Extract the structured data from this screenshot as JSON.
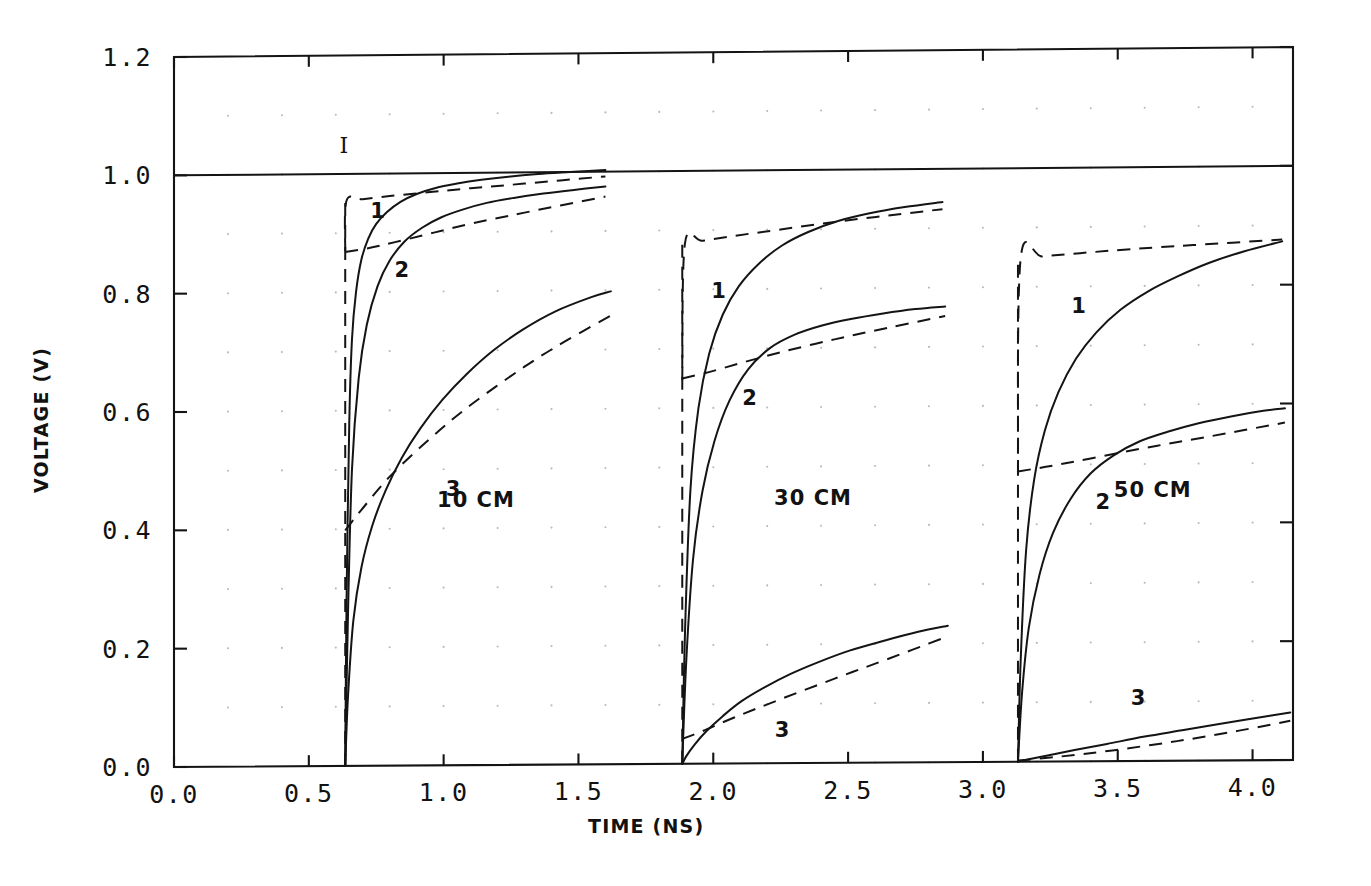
{
  "chart_data": {
    "type": "line",
    "title": "",
    "xlabel": "TIME (NS)",
    "ylabel": "VOLTAGE (V)",
    "xlim": [
      0.0,
      4.15
    ],
    "ylim": [
      0.0,
      1.2
    ],
    "xticks": [
      0.0,
      0.5,
      1.0,
      1.5,
      2.0,
      2.5,
      3.0,
      3.5,
      4.0
    ],
    "xticklabels": [
      "0.0",
      "0.5",
      "1.0",
      "1.5",
      "2.0",
      "2.5",
      "3.0",
      "3.5",
      "4.0"
    ],
    "yticks": [
      0.0,
      0.2,
      0.4,
      0.6,
      0.8,
      1.0,
      1.2
    ],
    "yticklabels": [
      "0.0",
      "0.2",
      "0.4",
      "0.6",
      "0.8",
      "1.0",
      "1.2"
    ],
    "grid": "dotted",
    "grid_x_step": 0.1,
    "grid_y_step": 0.05,
    "legend_position": "inline-annotations",
    "annotations": [
      {
        "text": "I",
        "x": 0.63,
        "y": 1.035,
        "note": "ideal step reference line label"
      },
      {
        "text": "10 CM",
        "x": 1.12,
        "y": 0.435
      },
      {
        "text": "30 CM",
        "x": 2.37,
        "y": 0.435
      },
      {
        "text": "50 CM",
        "x": 3.63,
        "y": 0.445
      },
      {
        "text": "1",
        "x": 0.755,
        "y": 0.925
      },
      {
        "text": "2",
        "x": 0.845,
        "y": 0.825
      },
      {
        "text": "3",
        "x": 1.035,
        "y": 0.455
      },
      {
        "text": "1",
        "x": 2.02,
        "y": 0.785
      },
      {
        "text": "2",
        "x": 2.135,
        "y": 0.605
      },
      {
        "text": "3",
        "x": 2.255,
        "y": 0.045
      },
      {
        "text": "1",
        "x": 3.355,
        "y": 0.755
      },
      {
        "text": "2",
        "x": 3.445,
        "y": 0.425
      },
      {
        "text": "3",
        "x": 3.575,
        "y": 0.095
      }
    ],
    "reference_line": {
      "name": "ideal-step",
      "label": "I",
      "y": 1.0,
      "style": "solid",
      "x_from": 0.0,
      "x_to": 4.15
    },
    "series": [
      {
        "name": "10CM-1-exact",
        "group": "10 CM",
        "curve": "1",
        "style": "solid",
        "x": [
          0.635,
          0.64,
          0.65,
          0.66,
          0.675,
          0.695,
          0.72,
          0.75,
          0.79,
          0.84,
          0.9,
          0.97,
          1.05,
          1.14,
          1.24,
          1.35,
          1.47,
          1.6
        ],
        "y": [
          0.0,
          0.28,
          0.58,
          0.72,
          0.8,
          0.855,
          0.89,
          0.915,
          0.935,
          0.952,
          0.965,
          0.975,
          0.982,
          0.988,
          0.993,
          0.997,
          1.0,
          1.003
        ]
      },
      {
        "name": "10CM-1-approx",
        "group": "10 CM",
        "curve": "1",
        "style": "dashed",
        "x": [
          0.635,
          0.64,
          0.7,
          0.8,
          0.95,
          1.1,
          1.3,
          1.6
        ],
        "y": [
          0.87,
          0.955,
          0.957,
          0.962,
          0.968,
          0.974,
          0.981,
          0.992
        ]
      },
      {
        "name": "10CM-2-exact",
        "group": "10 CM",
        "curve": "2",
        "style": "solid",
        "x": [
          0.635,
          0.645,
          0.66,
          0.685,
          0.715,
          0.755,
          0.8,
          0.855,
          0.92,
          0.99,
          1.07,
          1.16,
          1.26,
          1.37,
          1.49,
          1.6
        ],
        "y": [
          0.0,
          0.25,
          0.5,
          0.655,
          0.745,
          0.81,
          0.853,
          0.885,
          0.908,
          0.925,
          0.938,
          0.949,
          0.957,
          0.964,
          0.97,
          0.975
        ]
      },
      {
        "name": "10CM-2-approx",
        "group": "10 CM",
        "curve": "2",
        "style": "dashed",
        "x": [
          0.635,
          0.72,
          0.82,
          0.95,
          1.1,
          1.3,
          1.6
        ],
        "y": [
          0.868,
          0.874,
          0.884,
          0.898,
          0.914,
          0.932,
          0.958
        ]
      },
      {
        "name": "10CM-3-exact",
        "group": "10 CM",
        "curve": "3",
        "style": "solid",
        "x": [
          0.635,
          0.645,
          0.665,
          0.695,
          0.735,
          0.785,
          0.845,
          0.915,
          0.995,
          1.085,
          1.185,
          1.295,
          1.415,
          1.545,
          1.62
        ],
        "y": [
          0.0,
          0.115,
          0.245,
          0.335,
          0.405,
          0.465,
          0.52,
          0.57,
          0.617,
          0.66,
          0.7,
          0.735,
          0.765,
          0.788,
          0.798
        ]
      },
      {
        "name": "10CM-3-approx",
        "group": "10 CM",
        "curve": "3",
        "style": "dashed",
        "x": [
          0.635,
          0.7,
          0.8,
          0.95,
          1.1,
          1.3,
          1.45,
          1.62
        ],
        "y": [
          0.398,
          0.435,
          0.488,
          0.552,
          0.608,
          0.672,
          0.714,
          0.757
        ]
      },
      {
        "name": "30CM-1-exact",
        "group": "30 CM",
        "curve": "1",
        "style": "solid",
        "x": [
          1.885,
          1.895,
          1.915,
          1.945,
          1.985,
          2.035,
          2.095,
          2.17,
          2.255,
          2.35,
          2.46,
          2.58,
          2.71,
          2.85
        ],
        "y": [
          0.0,
          0.22,
          0.46,
          0.6,
          0.692,
          0.757,
          0.805,
          0.843,
          0.873,
          0.895,
          0.913,
          0.926,
          0.936,
          0.944
        ]
      },
      {
        "name": "30CM-1-approx",
        "group": "30 CM",
        "curve": "1",
        "style": "dashed",
        "x": [
          1.885,
          1.895,
          1.96,
          2.08,
          2.25,
          2.45,
          2.65,
          2.85
        ],
        "y": [
          0.648,
          0.878,
          0.882,
          0.89,
          0.9,
          0.912,
          0.922,
          0.932
        ]
      },
      {
        "name": "30CM-2-exact",
        "group": "30 CM",
        "curve": "2",
        "style": "solid",
        "x": [
          1.885,
          1.9,
          1.925,
          1.96,
          2.005,
          2.06,
          2.13,
          2.21,
          2.3,
          2.4,
          2.51,
          2.63,
          2.75,
          2.86
        ],
        "y": [
          0.0,
          0.175,
          0.345,
          0.46,
          0.545,
          0.612,
          0.665,
          0.7,
          0.722,
          0.737,
          0.748,
          0.757,
          0.764,
          0.768
        ]
      },
      {
        "name": "30CM-2-approx",
        "group": "30 CM",
        "curve": "2",
        "style": "dashed",
        "x": [
          1.885,
          1.98,
          2.1,
          2.25,
          2.45,
          2.65,
          2.86
        ],
        "y": [
          0.65,
          0.66,
          0.675,
          0.693,
          0.714,
          0.733,
          0.752
        ]
      },
      {
        "name": "30CM-3-exact",
        "group": "30 CM",
        "curve": "3",
        "style": "solid",
        "x": [
          1.885,
          1.9,
          1.93,
          1.975,
          2.035,
          2.105,
          2.19,
          2.285,
          2.39,
          2.505,
          2.63,
          2.76,
          2.87
        ],
        "y": [
          0.0,
          0.013,
          0.032,
          0.055,
          0.08,
          0.105,
          0.128,
          0.15,
          0.17,
          0.189,
          0.205,
          0.22,
          0.23
        ]
      },
      {
        "name": "30CM-3-approx",
        "group": "30 CM",
        "curve": "3",
        "style": "dashed",
        "x": [
          1.885,
          1.96,
          2.08,
          2.25,
          2.45,
          2.65,
          2.87
        ],
        "y": [
          0.042,
          0.055,
          0.078,
          0.108,
          0.142,
          0.175,
          0.212
        ]
      },
      {
        "name": "50CM-1-exact",
        "group": "50 CM",
        "curve": "1",
        "style": "solid",
        "x": [
          3.13,
          3.14,
          3.16,
          3.19,
          3.23,
          3.28,
          3.345,
          3.42,
          3.51,
          3.61,
          3.72,
          3.84,
          3.97,
          4.11
        ],
        "y": [
          0.0,
          0.17,
          0.355,
          0.475,
          0.558,
          0.622,
          0.678,
          0.722,
          0.76,
          0.79,
          0.815,
          0.838,
          0.857,
          0.873
        ]
      },
      {
        "name": "50CM-1-approx",
        "group": "50 CM",
        "curve": "1",
        "style": "dashed",
        "x": [
          3.13,
          3.14,
          3.22,
          3.36,
          3.55,
          3.78,
          4.11
        ],
        "y": [
          0.487,
          0.848,
          0.851,
          0.856,
          0.862,
          0.868,
          0.876
        ]
      },
      {
        "name": "50CM-2-exact",
        "group": "50 CM",
        "curve": "2",
        "style": "solid",
        "x": [
          3.13,
          3.145,
          3.17,
          3.21,
          3.26,
          3.325,
          3.4,
          3.485,
          3.58,
          3.685,
          3.8,
          3.92,
          4.04,
          4.12
        ],
        "y": [
          0.0,
          0.115,
          0.225,
          0.315,
          0.385,
          0.442,
          0.485,
          0.515,
          0.538,
          0.554,
          0.568,
          0.579,
          0.588,
          0.592
        ]
      },
      {
        "name": "50CM-2-approx",
        "group": "50 CM",
        "curve": "2",
        "style": "dashed",
        "x": [
          3.13,
          3.24,
          3.4,
          3.6,
          3.82,
          4.12
        ],
        "y": [
          0.489,
          0.497,
          0.51,
          0.527,
          0.544,
          0.568
        ]
      },
      {
        "name": "50CM-3-exact",
        "group": "50 CM",
        "curve": "3",
        "style": "solid",
        "x": [
          3.13,
          3.17,
          3.24,
          3.34,
          3.46,
          3.6,
          3.75,
          3.91,
          4.07,
          4.14
        ],
        "y": [
          0.0,
          0.004,
          0.01,
          0.019,
          0.029,
          0.041,
          0.052,
          0.064,
          0.075,
          0.08
        ]
      },
      {
        "name": "50CM-3-approx",
        "group": "50 CM",
        "curve": "3",
        "style": "dashed",
        "x": [
          3.13,
          3.28,
          3.48,
          3.72,
          3.95,
          4.14
        ],
        "y": [
          0.002,
          0.008,
          0.018,
          0.033,
          0.05,
          0.066
        ]
      }
    ]
  },
  "axes": {
    "x_title": "TIME (NS)",
    "y_title": "VOLTAGE (V)"
  },
  "colors": {
    "ink": "#141414",
    "grid_dot": "#b9b9b9",
    "background": "#ffffff"
  }
}
